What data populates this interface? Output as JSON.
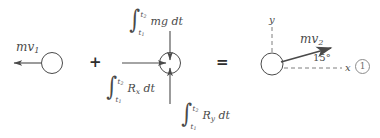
{
  "figure": {
    "type": "impulse-momentum-diagram",
    "caption_number": "1",
    "stroke_color": "#4a4a4a",
    "text_color": "#4a4a4a"
  },
  "terms": {
    "initial_momentum": {
      "label_m": "m",
      "label_v": "v",
      "label_sub": "1",
      "direction": "left"
    },
    "plus_operator": "+",
    "equals_operator": "=",
    "final_momentum": {
      "label_m": "m",
      "label_v": "v",
      "label_sub": "2",
      "direction": "up-right",
      "angle_label": "15°"
    }
  },
  "impulses": [
    {
      "name": "weight-impulse",
      "int_sign": "∫",
      "lower_limit_t": "t",
      "lower_limit_sub": "1",
      "upper_limit_t": "t",
      "upper_limit_sub": "2",
      "integrand": "mg dt",
      "direction": "down"
    },
    {
      "name": "reaction-x-impulse",
      "int_sign": "∫",
      "lower_limit_t": "t",
      "lower_limit_sub": "1",
      "upper_limit_t": "t",
      "upper_limit_sub": "2",
      "integrand_R": "R",
      "integrand_sub": "x",
      "integrand_dt": "dt",
      "direction": "right"
    },
    {
      "name": "reaction-y-impulse",
      "int_sign": "∫",
      "lower_limit_t": "t",
      "lower_limit_sub": "1",
      "upper_limit_t": "t",
      "upper_limit_sub": "2",
      "integrand_R": "R",
      "integrand_sub": "y",
      "integrand_dt": "dt",
      "direction": "up"
    }
  ],
  "axes": {
    "y_label": "y",
    "x_label": "x"
  }
}
